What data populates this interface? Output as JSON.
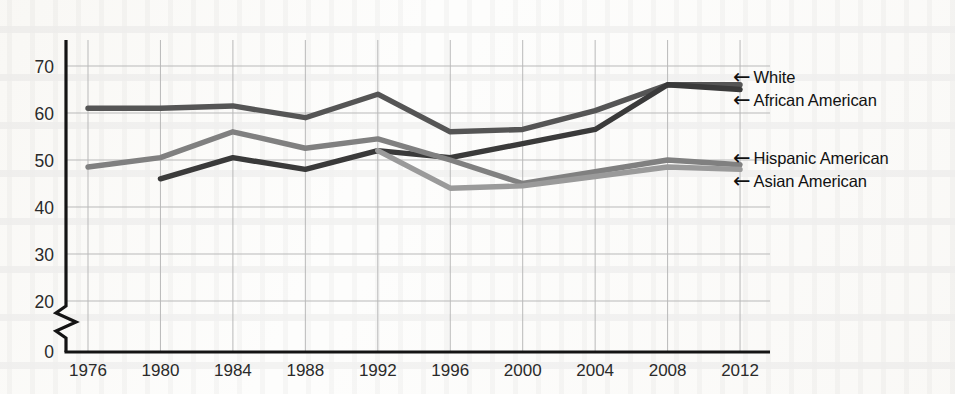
{
  "chart_data": {
    "type": "line",
    "title": "",
    "subtitle": "",
    "xlabel": "",
    "ylabel": "",
    "x": [
      1976,
      1980,
      1984,
      1988,
      1992,
      1996,
      2000,
      2004,
      2008,
      2012
    ],
    "categories": [
      "1976",
      "1980",
      "1984",
      "1988",
      "1992",
      "1996",
      "2000",
      "2004",
      "2008",
      "2012"
    ],
    "xlim": [
      1976,
      2012
    ],
    "ylim": [
      20,
      74
    ],
    "y_ticks": [
      20,
      30,
      40,
      50,
      60,
      70
    ],
    "y_tick_labels": [
      "20",
      "30",
      "40",
      "50",
      "60",
      "70"
    ],
    "zero_label": "0",
    "axis_break": true,
    "axis_break_note": "y-axis broken between 0 and 20",
    "grid": true,
    "grid_color": "#b9b9b9",
    "legend_position": "right-inline-arrows",
    "series": [
      {
        "name": "White",
        "color": "#555555",
        "x": [
          1976,
          1980,
          1984,
          1988,
          1992,
          1996,
          2000,
          2004,
          2008,
          2012
        ],
        "values": [
          61.0,
          61.0,
          61.5,
          59.0,
          64.0,
          56.0,
          56.5,
          60.5,
          66.0,
          66.0
        ]
      },
      {
        "name": "African American",
        "color": "#3a3a3a",
        "x": [
          1980,
          1984,
          1988,
          1992,
          1996,
          2000,
          2004,
          2008,
          2012
        ],
        "values": [
          46.0,
          50.5,
          48.0,
          52.0,
          50.5,
          53.5,
          56.5,
          66.0,
          65.0
        ]
      },
      {
        "name": "Hispanic American",
        "color": "#808080",
        "x": [
          1976,
          1980,
          1984,
          1988,
          1992,
          1996,
          2000,
          2004,
          2008,
          2012
        ],
        "values": [
          48.5,
          50.5,
          56.0,
          52.5,
          54.5,
          50.0,
          45.0,
          47.5,
          50.0,
          49.0
        ]
      },
      {
        "name": "Asian American",
        "color": "#9a9a9a",
        "x": [
          1992,
          1996,
          2000,
          2004,
          2008,
          2012
        ],
        "values": [
          52.0,
          44.0,
          44.5,
          46.5,
          48.5,
          48.0
        ]
      }
    ]
  },
  "legend": {
    "arrow_glyph": "←",
    "entries": [
      {
        "label": "White",
        "y": 78
      },
      {
        "label": "African American",
        "y": 101
      },
      {
        "label": "Hispanic American",
        "y": 159
      },
      {
        "label": "Asian American",
        "y": 182
      }
    ]
  },
  "axes": {
    "y_labels": [
      "70",
      "60",
      "50",
      "40",
      "30",
      "20"
    ],
    "y_zero": "0",
    "x_labels": [
      "1976",
      "1980",
      "1984",
      "1988",
      "1992",
      "1996",
      "2000",
      "2004",
      "2008",
      "2012"
    ]
  }
}
